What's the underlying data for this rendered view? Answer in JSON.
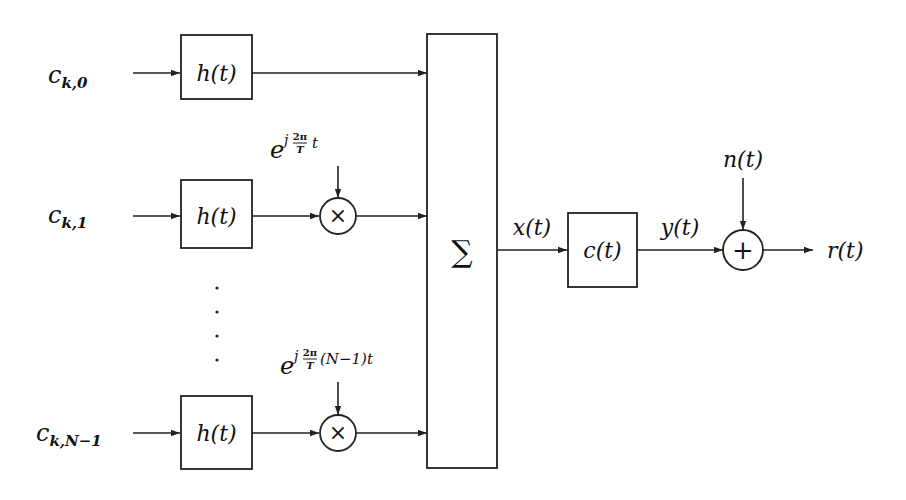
{
  "diagram": {
    "inputs": [
      {
        "base": "c",
        "sub": "k,0"
      },
      {
        "base": "c",
        "sub": "k,1"
      },
      {
        "base": "c",
        "sub": "k,N−1"
      }
    ],
    "filters": [
      {
        "label": "h(t)"
      },
      {
        "label": "h(t)"
      },
      {
        "label": "h(t)"
      }
    ],
    "modulators": [
      {
        "symbol": "×",
        "carrier": {
          "base": "e",
          "exp_frac_num": "2π",
          "exp_frac_den": "T",
          "exp_pre": "j",
          "exp_post": "t"
        }
      },
      {
        "symbol": "×",
        "carrier": {
          "base": "e",
          "exp_frac_num": "2π",
          "exp_frac_den": "T",
          "exp_pre": "j",
          "exp_post": "(N−1)t"
        }
      }
    ],
    "ellipsis": "⋮",
    "summer": {
      "symbol": "∑"
    },
    "signals": {
      "x": "x(t)",
      "y": "y(t)",
      "n": "n(t)",
      "r": "r(t)"
    },
    "channel": {
      "label": "c(t)"
    },
    "adder": {
      "symbol": "+"
    }
  }
}
